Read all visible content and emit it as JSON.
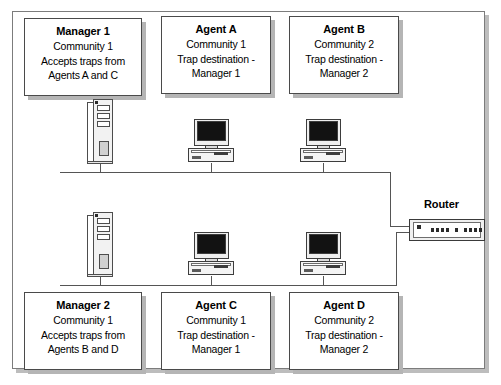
{
  "diagram": {
    "type": "network-topology"
  },
  "nodes": [
    {
      "id": "manager-1",
      "role": "manager",
      "title": "Manager 1",
      "line1": "Community 1",
      "line2": "Accepts traps from",
      "line3": "Agents A and C",
      "device": "server-tower",
      "segment": "top"
    },
    {
      "id": "agent-a",
      "role": "agent",
      "title": "Agent A",
      "line1": "Community 1",
      "line2": "Trap destination -",
      "line3": "Manager 1",
      "device": "desktop-pc",
      "segment": "top"
    },
    {
      "id": "agent-b",
      "role": "agent",
      "title": "Agent B",
      "line1": "Community 2",
      "line2": "Trap destination -",
      "line3": "Manager 2",
      "device": "desktop-pc",
      "segment": "top"
    },
    {
      "id": "manager-2",
      "role": "manager",
      "title": "Manager 2",
      "line1": "Community 1",
      "line2": "Accepts traps from",
      "line3": "Agents B and D",
      "device": "server-tower",
      "segment": "bottom"
    },
    {
      "id": "agent-c",
      "role": "agent",
      "title": "Agent C",
      "line1": "Community 1",
      "line2": "Trap destination -",
      "line3": "Manager 1",
      "device": "desktop-pc",
      "segment": "bottom"
    },
    {
      "id": "agent-d",
      "role": "agent",
      "title": "Agent D",
      "line1": "Community 2",
      "line2": "Trap destination -",
      "line3": "Manager 2",
      "device": "desktop-pc",
      "segment": "bottom"
    }
  ],
  "router": {
    "label": "Router",
    "led_count": 10
  },
  "colors": {
    "frame_border": "#7c7c7c",
    "frame_shadow": "#bdbdbd",
    "box_border": "#4a4a4a",
    "box_shadow": "#b5b5b5",
    "line": "#555555",
    "screen": "#121212",
    "text": "#000000",
    "background": "#ffffff"
  }
}
